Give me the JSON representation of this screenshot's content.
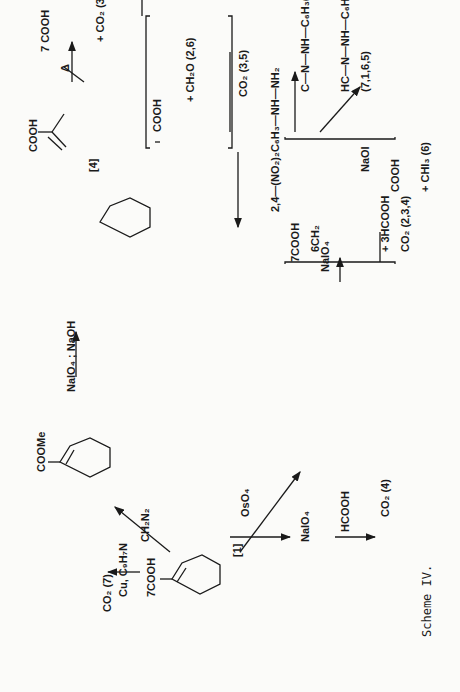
{
  "caption": "Scheme IV.",
  "compounds": {
    "shikimic_acid": {
      "label": "[1]",
      "substituents": [
        "7COOH",
        "HO",
        "OH",
        "OH"
      ],
      "atom_numbers": [
        "1",
        "2",
        "3",
        "4",
        "5",
        "6"
      ]
    },
    "methyl_ester": {
      "substituents": [
        "COOMe",
        "HO",
        "OH",
        "OH"
      ]
    },
    "triacid": {
      "label": "[4]",
      "groups": [
        "COOH",
        "HOOC",
        "COOH"
      ],
      "numbers": [
        "1",
        "2,6",
        "3,5",
        "2,6",
        "3,5"
      ]
    },
    "itaconic": {
      "groups": [
        "7 COOH",
        "HOOC",
        "CH₂ 2,6"
      ],
      "numbers": [
        "1",
        "2,6",
        "3,5"
      ],
      "byproduct": "+ CO₂ (3,5)"
    },
    "oxaloacetate_bracket": {
      "groups": [
        "COOH",
        "CO",
        "H₂C",
        "COOH"
      ],
      "byproducts": [
        "+ CH₂O (2,6)",
        "CO₂ (3,5)"
      ]
    },
    "tetraol": {
      "groups": [
        "COOH",
        "HO",
        "HO",
        "OH",
        "HO",
        "OH"
      ]
    },
    "dialdehyde_bracket": {
      "groups": [
        "7COOH",
        "1CO",
        "6CH₂",
        "5CHO"
      ],
      "byproducts": [
        "+ 3HCOOH",
        "CO₂ (2,3,4)"
      ]
    },
    "osazone": {
      "lines": [
        "COOH",
        "C—N—NH—C₆H₃(NO₂)₂",
        "CH₂",
        "HC—N—NH—C₆H₃(NO₂)₂"
      ],
      "label": "(7,1,6,5)"
    },
    "oxalic": {
      "lines": [
        "COOH",
        "COOH"
      ],
      "label": "(1,7)",
      "byproduct": "+ CHI₃ (6)"
    },
    "formic": {
      "text": "HCOOH",
      "product": "CO₂ (4)"
    }
  },
  "reagents": {
    "decarboxylation": "Cu, C₉H₇N",
    "decarboxylation_product": "CO₂ (7)",
    "esterification": "CH₂N₂",
    "periodate_base": "NaIO₄ ; NaOH",
    "heat": "Δ",
    "periodate": "NaIO₄",
    "osmylation": "OsO₄",
    "periodate2": "NaIO₄",
    "periodate3": "NaIO₄",
    "hydrazine": "2,4—(NO₂)₂C₆H₃—NH—NH₂",
    "iodoform": "NaOI"
  }
}
